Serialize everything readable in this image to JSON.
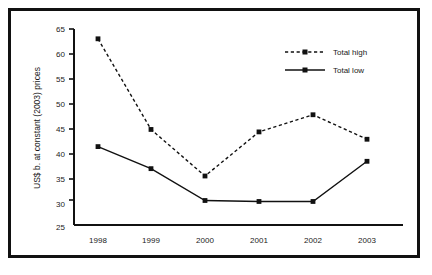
{
  "chart_data": {
    "type": "line",
    "title": "",
    "xlabel": "",
    "ylabel": "US$ b. at constant (2003) prices",
    "categories": [
      "1998",
      "1999",
      "2000",
      "2001",
      "2002",
      "2003"
    ],
    "xtick_labels": [
      "1998",
      "1999",
      "2000",
      "2001",
      "2002",
      "2003"
    ],
    "ytick_labels": [
      "25",
      "30",
      "35",
      "40",
      "45",
      "50",
      "55",
      "60",
      "65"
    ],
    "ytick_values": [
      25,
      30,
      35,
      40,
      45,
      50,
      55,
      60,
      65
    ],
    "ylim": [
      25,
      65
    ],
    "grid": false,
    "legend_position": "top-right",
    "series": [
      {
        "name": "Total high",
        "style": "dashed",
        "marker": "square",
        "color": "#111111",
        "values": [
          63.0,
          44.5,
          35.0,
          44.0,
          47.5,
          42.5
        ]
      },
      {
        "name": "Total low",
        "style": "solid",
        "marker": "square",
        "color": "#111111",
        "values": [
          41.0,
          36.5,
          30.0,
          29.8,
          29.8,
          38.0
        ]
      }
    ]
  },
  "legend": {
    "entries": [
      {
        "label": "Total high"
      },
      {
        "label": "Total low"
      }
    ]
  },
  "axes": {
    "y_axis_label": "US$ b. at constant (2003) prices",
    "y_ticks": [
      "65",
      "60",
      "55",
      "50",
      "45",
      "40",
      "35",
      "30",
      "25"
    ],
    "x_ticks": [
      "1998",
      "1999",
      "2000",
      "2001",
      "2002",
      "2003"
    ]
  },
  "colors": {
    "ink": "#111111",
    "background": "#ffffff"
  }
}
